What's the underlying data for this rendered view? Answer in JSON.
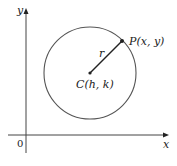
{
  "diagram": {
    "type": "circle-on-axes",
    "axes": {
      "x_label": "x",
      "y_label": "y",
      "origin_label": "0"
    },
    "center": {
      "label": "C(h, k)",
      "px": [
        90,
        73
      ]
    },
    "point": {
      "label": "P(x, y)",
      "px": [
        122,
        41
      ]
    },
    "radius": {
      "label": "r",
      "px": 46
    },
    "colors": {
      "stroke": "#333333",
      "circle": "#555555"
    }
  }
}
